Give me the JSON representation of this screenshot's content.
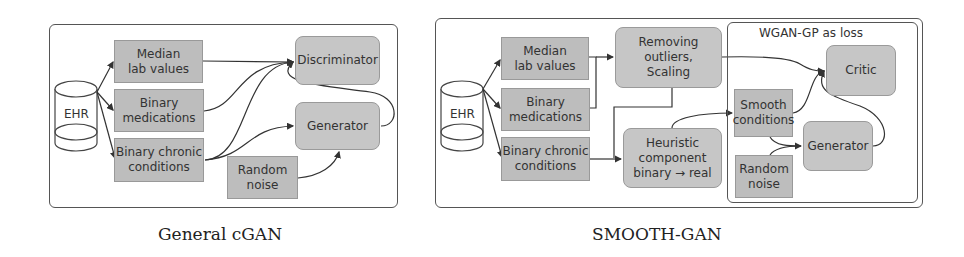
{
  "left_diagram": {
    "caption": "General cGAN",
    "source": {
      "label": "EHR"
    },
    "inputs": [
      {
        "label": "Median\nlab values"
      },
      {
        "label": "Binary\nmedications"
      },
      {
        "label": "Binary chronic\nconditions"
      }
    ],
    "noise": {
      "label": "Random\nnoise"
    },
    "discriminator": {
      "label": "Discriminator"
    },
    "generator": {
      "label": "Generator"
    }
  },
  "right_diagram": {
    "caption": "SMOOTH-GAN",
    "source": {
      "label": "EHR"
    },
    "inputs": [
      {
        "label": "Median\nlab values"
      },
      {
        "label": "Binary\nmedications"
      },
      {
        "label": "Binary chronic\nconditions"
      }
    ],
    "preprocess": {
      "label": "Removing\noutliers,\nScaling"
    },
    "heuristic": {
      "label": "Heuristic\ncomponent\nbinary → real"
    },
    "loss_group": {
      "title": "WGAN-GP as loss",
      "smooth": {
        "label": "Smooth\nconditions"
      },
      "noise": {
        "label": "Random\nnoise"
      },
      "critic": {
        "label": "Critic"
      },
      "generator": {
        "label": "Generator"
      }
    }
  },
  "colors": {
    "box_fill": "#bdbdbd",
    "rounded_box_fill": "#c6c6c6",
    "line": "#333333",
    "panel_border": "#555555"
  }
}
